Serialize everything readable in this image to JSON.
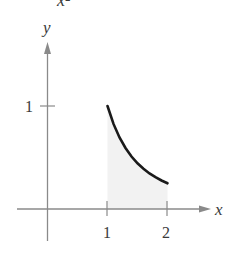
{
  "caption_fragment": "x²",
  "chart_data": {
    "type": "line",
    "title": "",
    "function": "y = 1/x^2",
    "xlabel": "x",
    "ylabel": "y",
    "x_ticks": [
      "1",
      "2"
    ],
    "y_ticks": [
      "1"
    ],
    "xlim": [
      -0.5,
      2.7
    ],
    "ylim": [
      -0.3,
      1.6
    ],
    "grid": false,
    "shaded_region": {
      "x_from": 1,
      "x_to": 2,
      "under": "curve"
    },
    "series": [
      {
        "name": "1/x^2",
        "x": [
          1.0,
          1.1,
          1.2,
          1.3,
          1.4,
          1.5,
          1.6,
          1.7,
          1.8,
          1.9,
          2.0
        ],
        "values": [
          1.0,
          0.826,
          0.694,
          0.592,
          0.51,
          0.444,
          0.391,
          0.346,
          0.309,
          0.277,
          0.25
        ]
      }
    ]
  },
  "colors": {
    "axis": "#8a8a8a",
    "curve": "#1a1a1a",
    "shade": "#f2f2f2",
    "text": "#3a3a3a"
  }
}
